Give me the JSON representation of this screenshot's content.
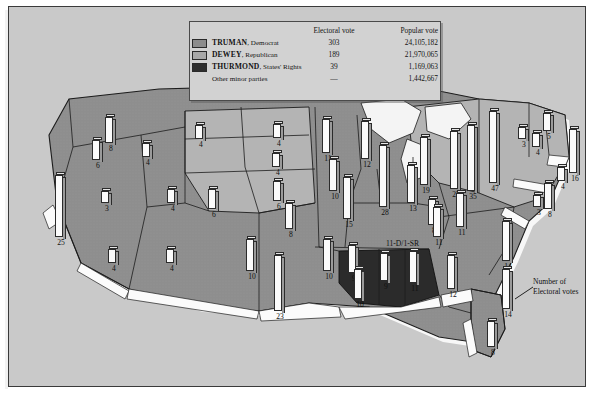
{
  "legend": {
    "headers": {
      "blank": "",
      "electoral": "Electoral vote",
      "popular": "Popular vote"
    },
    "rows": [
      {
        "swatch": "truman-swatch",
        "color": "#8c8c8c",
        "name": "TRUMAN",
        "party": ", Democrat",
        "electoral": "303",
        "popular": "24,105,182"
      },
      {
        "swatch": "dewey-swatch",
        "color": "#a8a8a8",
        "name": "DEWEY",
        "party": ", Republican",
        "electoral": "189",
        "popular": "21,970,065"
      },
      {
        "swatch": "thurmond-swatch",
        "color": "#2e2e2e",
        "name": "THURMOND",
        "party": ", States' Rights",
        "electoral": "39",
        "popular": "1,169,063"
      },
      {
        "swatch": "none",
        "color": "",
        "name": "",
        "party": "Other minor parties",
        "electoral": "—",
        "popular": "1,442,667"
      }
    ]
  },
  "key": {
    "bar_value": "14",
    "caption_line1": "Number of",
    "caption_line2": "Electoral votes"
  },
  "annotations": [
    {
      "name": "tennessee-split-note",
      "text": "11-D/1-SR",
      "x": 377,
      "y": 232
    }
  ],
  "chart_data": {
    "type": "map",
    "ylabel": "Electoral votes",
    "legend_position": "top-center",
    "categories": [
      "TRUMAN, Democrat",
      "DEWEY, Republican",
      "THURMOND, States' Rights",
      "Other minor parties"
    ],
    "series": [
      {
        "name": "Electoral vote",
        "values": [
          303,
          189,
          39,
          null
        ]
      },
      {
        "name": "Popular vote",
        "values": [
          24105182,
          21970065,
          1169063,
          1442667
        ]
      }
    ],
    "states": [
      {
        "label": "8",
        "value": 8,
        "winner": "TRUMAN",
        "x": 96,
        "y": 110,
        "h": 26
      },
      {
        "label": "6",
        "value": 6,
        "winner": "TRUMAN",
        "x": 83,
        "y": 133,
        "h": 20
      },
      {
        "label": "4",
        "value": 4,
        "winner": "TRUMAN",
        "x": 133,
        "y": 136,
        "h": 14
      },
      {
        "label": "25",
        "value": 25,
        "winner": "TRUMAN",
        "x": 46,
        "y": 168,
        "h": 62
      },
      {
        "label": "3",
        "value": 3,
        "winner": "TRUMAN",
        "x": 92,
        "y": 184,
        "h": 12
      },
      {
        "label": "4",
        "value": 4,
        "winner": "TRUMAN",
        "x": 158,
        "y": 182,
        "h": 14
      },
      {
        "label": "4",
        "value": 4,
        "winner": "TRUMAN",
        "x": 99,
        "y": 242,
        "h": 14
      },
      {
        "label": "4",
        "value": 4,
        "winner": "TRUMAN",
        "x": 157,
        "y": 242,
        "h": 14
      },
      {
        "label": "4",
        "value": 4,
        "winner": "DEWEY",
        "x": 186,
        "y": 118,
        "h": 14
      },
      {
        "label": "4",
        "value": 4,
        "winner": "DEWEY",
        "x": 264,
        "y": 117,
        "h": 14
      },
      {
        "label": "4",
        "value": 4,
        "winner": "DEWEY",
        "x": 263,
        "y": 146,
        "h": 14
      },
      {
        "label": "6",
        "value": 6,
        "winner": "DEWEY",
        "x": 199,
        "y": 182,
        "h": 20
      },
      {
        "label": "6",
        "value": 6,
        "winner": "DEWEY",
        "x": 264,
        "y": 174,
        "h": 20
      },
      {
        "label": "8",
        "value": 8,
        "winner": "DEWEY",
        "x": 276,
        "y": 196,
        "h": 26
      },
      {
        "label": "10",
        "value": 10,
        "winner": "TRUMAN",
        "x": 237,
        "y": 232,
        "h": 32
      },
      {
        "label": "11",
        "value": 11,
        "winner": "TRUMAN",
        "x": 313,
        "y": 112,
        "h": 34
      },
      {
        "label": "12",
        "value": 12,
        "winner": "TRUMAN",
        "x": 352,
        "y": 114,
        "h": 38
      },
      {
        "label": "10",
        "value": 10,
        "winner": "TRUMAN",
        "x": 320,
        "y": 152,
        "h": 32
      },
      {
        "label": "15",
        "value": 15,
        "winner": "TRUMAN",
        "x": 334,
        "y": 170,
        "h": 42
      },
      {
        "label": "28",
        "value": 28,
        "winner": "TRUMAN",
        "x": 370,
        "y": 138,
        "h": 62
      },
      {
        "label": "13",
        "value": 13,
        "winner": "TRUMAN",
        "x": 398,
        "y": 158,
        "h": 38
      },
      {
        "label": "19",
        "value": 19,
        "winner": "DEWEY",
        "x": 411,
        "y": 130,
        "h": 48
      },
      {
        "label": "25",
        "value": 25,
        "winner": "DEWEY",
        "x": 441,
        "y": 124,
        "h": 58
      },
      {
        "label": "47",
        "value": 47,
        "winner": "DEWEY",
        "x": 480,
        "y": 104,
        "h": 72
      },
      {
        "label": "35",
        "value": 35,
        "winner": "TRUMAN",
        "x": 458,
        "y": 118,
        "h": 66
      },
      {
        "label": "5",
        "value": 5,
        "winner": "DEWEY",
        "x": 534,
        "y": 106,
        "h": 18
      },
      {
        "label": "3",
        "value": 3,
        "winner": "DEWEY",
        "x": 509,
        "y": 120,
        "h": 12
      },
      {
        "label": "4",
        "value": 4,
        "winner": "DEWEY",
        "x": 523,
        "y": 126,
        "h": 14
      },
      {
        "label": "16",
        "value": 16,
        "winner": "DEWEY",
        "x": 560,
        "y": 122,
        "h": 44
      },
      {
        "label": "4",
        "value": 4,
        "winner": "DEWEY",
        "x": 548,
        "y": 160,
        "h": 14
      },
      {
        "label": "8",
        "value": 8,
        "winner": "DEWEY",
        "x": 535,
        "y": 176,
        "h": 26
      },
      {
        "label": "3",
        "value": 3,
        "winner": "DEWEY",
        "x": 524,
        "y": 188,
        "h": 12
      },
      {
        "label": "11",
        "value": 11,
        "winner": "TRUMAN",
        "x": 447,
        "y": 186,
        "h": 34
      },
      {
        "label": "8",
        "value": 8,
        "winner": "TRUMAN",
        "x": 419,
        "y": 192,
        "h": 26
      },
      {
        "label": "11",
        "value": 11,
        "winner": "TRUMAN",
        "x": 424,
        "y": 200,
        "h": 30
      },
      {
        "label": "14",
        "value": 14,
        "winner": "TRUMAN",
        "x": 493,
        "y": 214,
        "h": 40
      },
      {
        "label": "23",
        "value": 23,
        "winner": "TRUMAN",
        "x": 265,
        "y": 248,
        "h": 56
      },
      {
        "label": "10",
        "value": 10,
        "winner": "TRUMAN",
        "x": 314,
        "y": 232,
        "h": 32
      },
      {
        "label": "9",
        "value": 9,
        "winner": "TRUMAN",
        "x": 339,
        "y": 238,
        "h": 28
      },
      {
        "label": "10",
        "value": 10,
        "winner": "THURMOND",
        "x": 345,
        "y": 262,
        "h": 30
      },
      {
        "label": "9",
        "value": 9,
        "winner": "THURMOND",
        "x": 371,
        "y": 246,
        "h": 28
      },
      {
        "label": "11",
        "value": 11,
        "winner": "THURMOND",
        "x": 400,
        "y": 244,
        "h": 32
      },
      {
        "label": "12",
        "value": 12,
        "winner": "TRUMAN",
        "x": 438,
        "y": 248,
        "h": 34
      },
      {
        "label": "8",
        "value": 8,
        "winner": "TRUMAN",
        "x": 478,
        "y": 314,
        "h": 26
      }
    ]
  }
}
